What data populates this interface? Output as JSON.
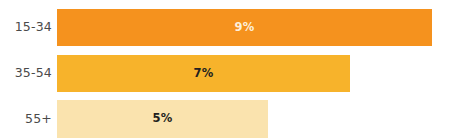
{
  "chart_data": {
    "type": "bar",
    "orientation": "horizontal",
    "title": "",
    "subtitle": "",
    "xlabel": "",
    "ylabel": "",
    "categories": [
      "15-34",
      "35-54",
      "55+"
    ],
    "values": [
      9,
      7,
      5
    ],
    "value_labels": [
      "9%",
      "7%",
      "5%"
    ],
    "value_suffix": "%",
    "xlim": [
      0,
      10.8
    ],
    "grid": false,
    "legend": false,
    "axis_lines": false,
    "tick_labels": [],
    "background_color": "#ffffff",
    "category_label_color": "#4a4a4a",
    "bars": [
      {
        "category": "15-34",
        "value": 9,
        "value_label": "9%",
        "color": "#f5921e",
        "value_label_color": "#fdf0dd",
        "pixel_width": 375
      },
      {
        "category": "35-54",
        "value": 7,
        "value_label": "7%",
        "color": "#f7b32b",
        "value_label_color": "#231f20",
        "pixel_width": 293
      },
      {
        "category": "55+",
        "value": 5,
        "value_label": "5%",
        "color": "#fae3ae",
        "value_label_color": "#231f20",
        "pixel_width": 211
      }
    ]
  }
}
